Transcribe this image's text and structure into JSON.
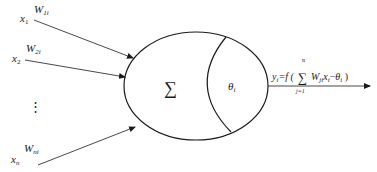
{
  "diagram": {
    "type": "artificial-neuron-model",
    "colors": {
      "stroke": "#1a1a1a",
      "background": "#ffffff"
    },
    "inputs": [
      {
        "var": "x",
        "sub": "1",
        "weight": "W",
        "weight_sub": "1i"
      },
      {
        "var": "x",
        "sub": "2",
        "weight": "W",
        "weight_sub": "2i"
      },
      {
        "var": "x",
        "sub": "n",
        "weight": "W",
        "weight_sub": "ni"
      }
    ],
    "ellipsis": "⋮",
    "neuron": {
      "sum_symbol": "∑",
      "threshold": "θ",
      "threshold_sub": "i"
    },
    "output": {
      "lhs": "y",
      "lhs_sub": "i",
      "eq": "=f (",
      "sum_symbol": "∑",
      "sum_upper": "n",
      "sum_lower": "j=1",
      "term_w": "W",
      "term_w_sub": "ji",
      "term_x": "x",
      "term_x_sub": "i",
      "minus": "−",
      "theta": "θ",
      "theta_sub": "i",
      "close": " )"
    }
  }
}
